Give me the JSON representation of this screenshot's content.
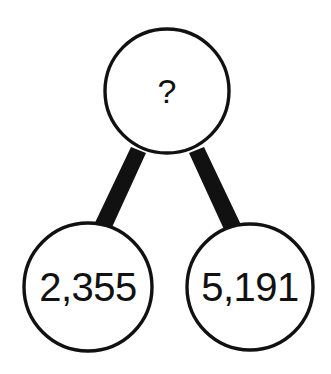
{
  "diagram": {
    "type": "number-bond",
    "background_color": "#ffffff",
    "stroke_color": "#111111",
    "fill_color": "#ffffff",
    "nodes": [
      {
        "id": "total",
        "role": "whole",
        "label": "?",
        "value": null,
        "cx": 167,
        "cy": 91,
        "r": 63
      },
      {
        "id": "part-left",
        "role": "part",
        "label": "2,355",
        "value": 2355,
        "cx": 88,
        "cy": 287,
        "r": 65
      },
      {
        "id": "part-right",
        "role": "part",
        "label": "5,191",
        "value": 5191,
        "cx": 250,
        "cy": 287,
        "r": 64
      }
    ],
    "connectors": [
      {
        "id": "connector-left",
        "from": "total",
        "to": "part-left"
      },
      {
        "id": "connector-right",
        "from": "total",
        "to": "part-right"
      }
    ]
  }
}
